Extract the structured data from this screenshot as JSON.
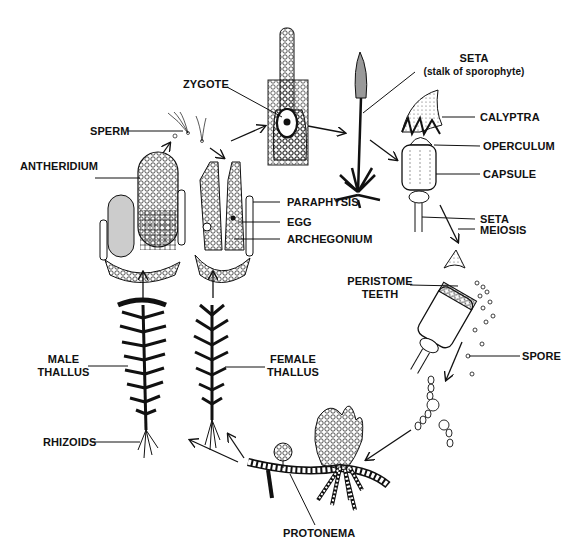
{
  "labels": {
    "zygote": "ZYGOTE",
    "sperm": "SPERM",
    "antheridium": "ANTHERIDIUM",
    "paraphysis": "PARAPHYSIS",
    "egg": "EGG",
    "archegonium": "ARCHEGONIUM",
    "seta_top_line1": "SETA",
    "seta_top_line2": "(stalk of sporophyte)",
    "calyptra": "CALYPTRA",
    "operculum": "OPERCULUM",
    "capsule": "CAPSULE",
    "seta": "SETA",
    "meiosis": "MEIOSIS",
    "peristome_line1": "PERISTOME",
    "peristome_line2": "TEETH",
    "spore": "SPORE",
    "male_line1": "MALE",
    "male_line2": "THALLUS",
    "female_line1": "FEMALE",
    "female_line2": "THALLUS",
    "rhizoids": "RHIZOIDS",
    "protonema": "PROTONEMA"
  },
  "colors": {
    "ink": "#111111",
    "background": "#ffffff",
    "shade": "#999999"
  }
}
